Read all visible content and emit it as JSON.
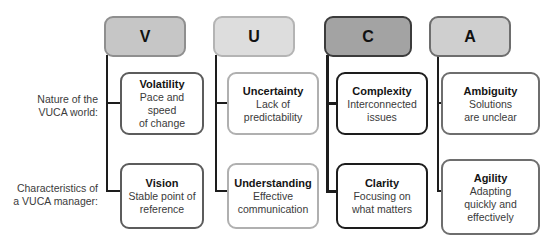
{
  "diagram": {
    "row_labels": [
      "Nature of the\nVUCA world:",
      "Characteristics of\na VUCA manager:"
    ],
    "columns": [
      {
        "key": "V",
        "letter": "V",
        "header_fill": "#c6c6c6",
        "header_border": "#8f8f8f",
        "box_border": "#5c5c5c",
        "connector_color": "#1d1d1d",
        "rows": [
          {
            "title": "Volatility",
            "desc": "Pace and speed\nof change"
          },
          {
            "title": "Vision",
            "desc": "Stable point of\nreference"
          }
        ]
      },
      {
        "key": "U",
        "letter": "U",
        "header_fill": "#dddddd",
        "header_border": "#b4b4b4",
        "box_border": "#b0b0b0",
        "connector_color": "#1d1d1d",
        "rows": [
          {
            "title": "Uncertainty",
            "desc": "Lack of\npredictability"
          },
          {
            "title": "Understanding",
            "desc": "Effective\ncommunication"
          }
        ]
      },
      {
        "key": "C",
        "letter": "C",
        "header_fill": "#a3a3a3",
        "header_border": "#3c3c3c",
        "box_border": "#1d1d1d",
        "connector_color": "#1d1d1d",
        "rows": [
          {
            "title": "Complexity",
            "desc": "Interconnected\nissues"
          },
          {
            "title": "Clarity",
            "desc": "Focusing on\nwhat matters"
          }
        ]
      },
      {
        "key": "A",
        "letter": "A",
        "header_fill": "#cfcfcf",
        "header_border": "#6e6e6e",
        "box_border": "#6e6e6e",
        "connector_color": "#1d1d1d",
        "rows": [
          {
            "title": "Ambiguity",
            "desc": "Solutions\nare unclear"
          },
          {
            "title": "Agility",
            "desc": "Adapting\nquickly and\neffectively"
          }
        ]
      }
    ]
  },
  "geometry": {
    "header_tops": 16,
    "header_height": 41,
    "row_tops": [
      72,
      163
    ],
    "row_heights": [
      63,
      73
    ],
    "columns_x": [
      104,
      215,
      326,
      437
    ],
    "header_widths": [
      82,
      82,
      88,
      82
    ],
    "box_x": [
      120,
      227,
      336,
      441
    ],
    "box_widths": [
      84,
      92,
      92,
      99
    ]
  }
}
